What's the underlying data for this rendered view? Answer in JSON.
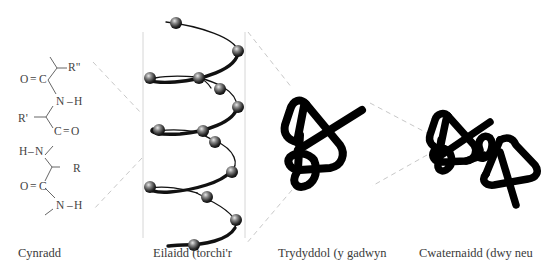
{
  "figure": {
    "panels": [
      {
        "id": "primary",
        "label": "Cynradd"
      },
      {
        "id": "secondary",
        "label": "Eilaidd (torchi'r"
      },
      {
        "id": "tertiary",
        "label": "Trydyddol (y gadwyn"
      },
      {
        "id": "quaternary",
        "label": "Cwaternaidd (dwy neu"
      }
    ],
    "primary_structure": {
      "atoms": {
        "r_double": "R\"",
        "o1": "O",
        "eq1": "=",
        "c1": "C",
        "n1": "N",
        "h1": "H",
        "r_single": "R'",
        "c2": "C",
        "eq2": "=",
        "o2": "O",
        "h2": "H",
        "n2": "N",
        "r": "R",
        "o3": "O",
        "eq3": "=",
        "c3": "C",
        "n3": "N",
        "h3": "H"
      }
    },
    "colors": {
      "background": "#ffffff",
      "text": "#3a3a3a",
      "bond": "#555555",
      "dash": "#c8c8c8",
      "guide": "#d6d6d6",
      "chain": "#111111",
      "sphere": "#555555"
    }
  }
}
